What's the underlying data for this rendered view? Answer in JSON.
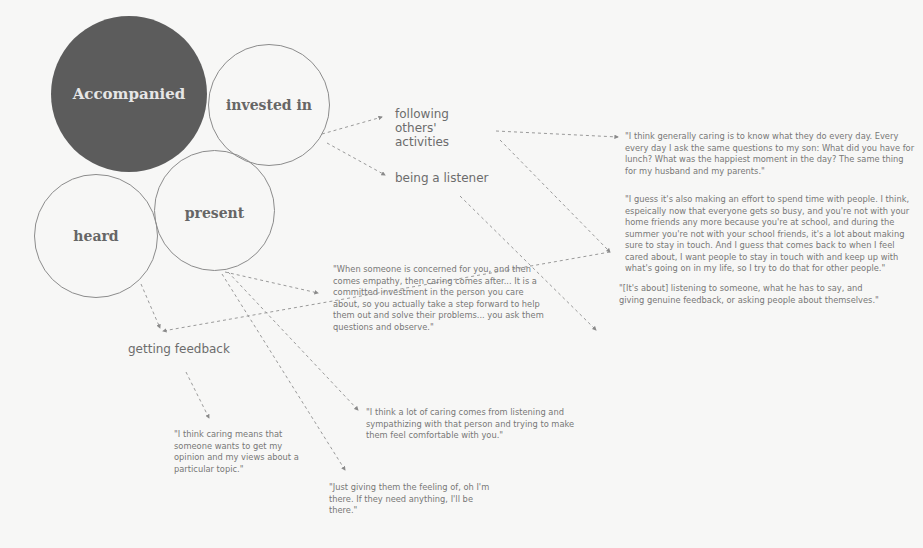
{
  "circles": {
    "accompanied": "Accompanied",
    "invested_in": "invested in",
    "present": "present",
    "heard": "heard"
  },
  "behaviors": {
    "following": "following others' activities",
    "listener": "being a listener",
    "feedback": "getting feedback"
  },
  "quotes": {
    "q1": "\"I think generally caring is to know what they do every day. Every every day I ask the same questions to my son: What did you have for lunch? What was the happiest moment in the day? The same thing for my husband and my parents.\"",
    "q2": "\"I guess it's also making an effort to spend time with people. I think, espeically now that everyone gets so busy, and you're not with your home friends any more because you're at school, and during the summer you're not with your school friends, it's a lot about making sure to stay in touch. And I guess that comes back to when I feel cared about, I want people to stay in touch with and keep up with what's going on in my life, so I try to do that for other people.\"",
    "q3": "\"[It's about] listening to someone, what he has to say, and giving genuine feedback, or asking people about themselves.\"",
    "q4": "\"When someone is concerned for you, and then comes empathy, then caring comes after... It is a committed investment in the person you care about, so you actually take a step forward to help them out and solve their problems... you ask them questions and observe.\"",
    "q5": "\"I think a lot of caring comes from listening and sympathizing with that person and trying to make them feel comfortable with you.\"",
    "q6": "\"I think caring means that someone wants to get my opinion and my views about a particular topic.\"",
    "q7": "\"Just giving them the feeling of, oh I'm there. If they need anything, I'll be there.\""
  },
  "colors": {
    "filled_circle": "#5c5c5c",
    "outline": "#8c8c8c",
    "background": "#f7f7f6",
    "connector": "#8a8a8a"
  }
}
